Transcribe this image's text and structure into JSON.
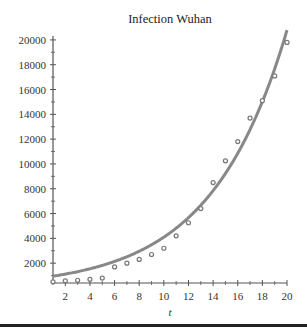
{
  "chart_data": {
    "type": "scatter",
    "title": "Infection Wuhan",
    "xlabel": "t",
    "ylabel": "",
    "xlim": [
      1,
      20
    ],
    "ylim": [
      400,
      20800
    ],
    "x_ticks": [
      2,
      4,
      6,
      8,
      10,
      12,
      14,
      16,
      18,
      20
    ],
    "y_ticks": [
      2000,
      4000,
      6000,
      8000,
      10000,
      12000,
      14000,
      16000,
      18000,
      20000
    ],
    "grid": false,
    "legend": null,
    "series": [
      {
        "name": "Observed infections",
        "kind": "scatter",
        "x": [
          1,
          2,
          3,
          4,
          5,
          6,
          7,
          8,
          9,
          10,
          11,
          12,
          13,
          14,
          15,
          16,
          17,
          18,
          19,
          20
        ],
        "values": [
          495,
          572,
          620,
          700,
          800,
          1700,
          2000,
          2300,
          2700,
          3200,
          4200,
          5260,
          6400,
          8500,
          10250,
          11800,
          13700,
          15100,
          17100,
          19800
        ]
      },
      {
        "name": "Exponential fit",
        "kind": "line",
        "model": "y = 950 * exp(0.1624 * (t - 1))",
        "x": [
          1,
          2,
          4,
          6,
          8,
          10,
          12,
          14,
          16,
          18,
          20
        ],
        "values": [
          950,
          1118,
          1549,
          2146,
          2973,
          4119,
          5706,
          7905,
          10950,
          15170,
          20800
        ]
      }
    ]
  },
  "colors": {
    "curve": "#888888",
    "points": "#777777",
    "axis": "#555555",
    "text": "#333333"
  }
}
